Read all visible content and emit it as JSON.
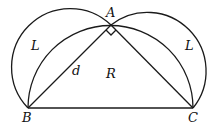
{
  "diagram": {
    "type": "geometry",
    "points": {
      "A": {
        "label": "A",
        "x": 111,
        "y": 25
      },
      "B": {
        "label": "B",
        "x": 28,
        "y": 108
      },
      "C": {
        "label": "C",
        "x": 193,
        "y": 108
      }
    },
    "labels": {
      "A": "A",
      "B": "B",
      "C": "C",
      "d": "d",
      "R": "R",
      "L_left": "L",
      "L_right": "L"
    },
    "right_angle_at": "A",
    "stroke_color": "#1a1a1a"
  }
}
